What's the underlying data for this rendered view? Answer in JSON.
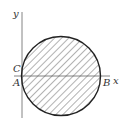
{
  "diagram": {
    "type": "coordinate-circle",
    "axes": {
      "x_label": "x",
      "y_label": "y"
    },
    "points": {
      "A": "A",
      "B": "B",
      "C": "C"
    },
    "circle": {
      "fill": "hatched",
      "stroke": "#222222",
      "hatch_color": "#555555"
    },
    "colors": {
      "axis": "#555555",
      "circle": "#222222",
      "text": "#333333"
    }
  }
}
